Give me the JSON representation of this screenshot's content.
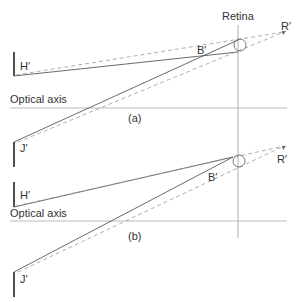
{
  "diagram": {
    "labels": {
      "retina": "Retina",
      "r_prime_a": "R′",
      "r_prime_b": "R′",
      "b_prime_a": "B′",
      "b_prime_b": "B′",
      "h_prime_a": "H′",
      "h_prime_b": "H′",
      "j_prime_a": "J′",
      "j_prime_b": "J′",
      "optical_axis_a": "Optical axis",
      "optical_axis_b": "Optical axis",
      "panel_a": "(a)",
      "panel_b": "(b)"
    },
    "colors": {
      "line": "#333333",
      "dashed": "#999999",
      "axis": "#aaaaaa"
    }
  }
}
